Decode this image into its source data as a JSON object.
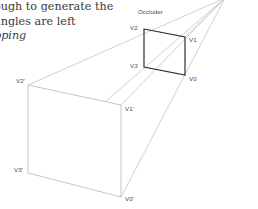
{
  "caption": {
    "line1": "ough to generate the",
    "line2": "angles are left",
    "line3": "pping"
  },
  "diagram": {
    "title": "Occluder",
    "occluder_vertices": {
      "v0": "V0",
      "v1": "V1",
      "v2": "V2",
      "v3": "V3"
    },
    "projected_vertices": {
      "v0": "V0'",
      "v1": "V1'",
      "v2": "V2'",
      "v3": "V3'"
    },
    "colors": {
      "occluder_stroke": "#2e2e2e",
      "ray_stroke": "#c4c4c4",
      "far_face_stroke": "#b8b8b8"
    }
  }
}
